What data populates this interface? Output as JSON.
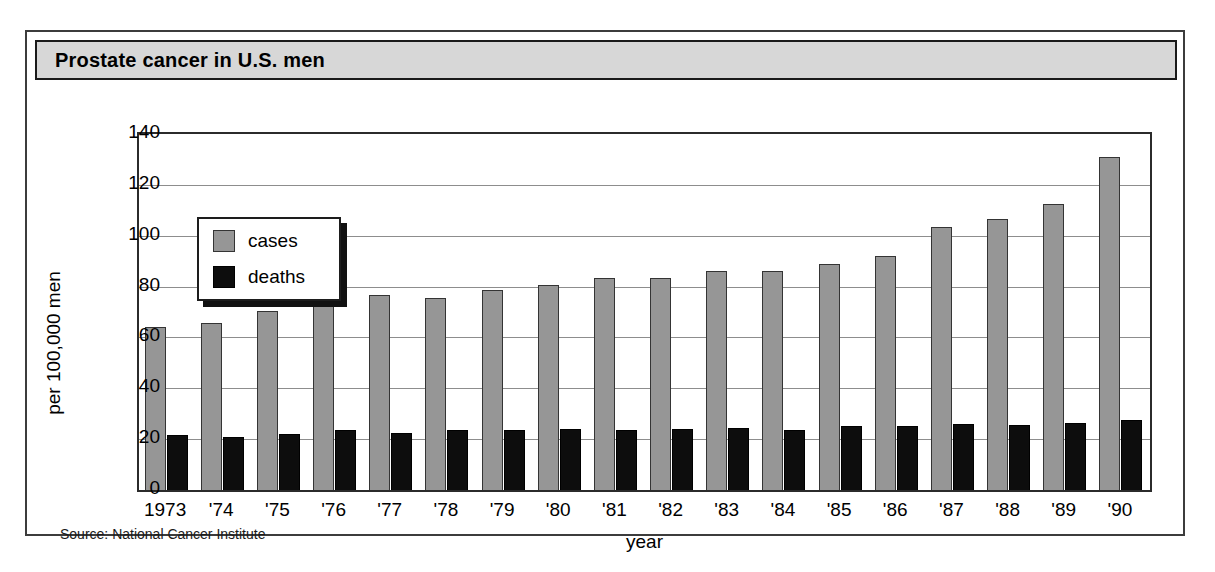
{
  "figure": {
    "title": "Prostate cancer in U.S. men",
    "source": "Source: National Cancer Institute"
  },
  "colors": {
    "cases": "#969696",
    "deaths": "#0d0d0d",
    "title_bar": "#d7d7d7",
    "frame": "#3c3c3c",
    "gridline": "#8d8d8d"
  },
  "legend": {
    "position": "upper-left-inside",
    "items": [
      {
        "label": "cases",
        "color": "#969696"
      },
      {
        "label": "deaths",
        "color": "#0d0d0d"
      }
    ]
  },
  "chart_data": {
    "type": "bar",
    "title": "Prostate cancer in U.S. men",
    "xlabel": "year",
    "ylabel": "per 100,000 men",
    "ylim": [
      0,
      140
    ],
    "yticks": [
      0,
      20,
      40,
      60,
      80,
      100,
      120,
      140
    ],
    "ytick_labels": [
      "0",
      "20",
      "40",
      "60",
      "80",
      "100",
      "120",
      "140"
    ],
    "grid": true,
    "legend_position": "upper left",
    "categories": [
      "1973",
      "'74",
      "'75",
      "'76",
      "'77",
      "'78",
      "'79",
      "'80",
      "'81",
      "'82",
      "'83",
      "'84",
      "'85",
      "'86",
      "'87",
      "'88",
      "'89",
      "'90"
    ],
    "series": [
      {
        "name": "cases",
        "color": "#969696",
        "values": [
          64,
          65.5,
          70.5,
          74,
          76.5,
          75.5,
          78.5,
          80.5,
          83.5,
          83.5,
          86,
          86,
          89,
          92,
          103.5,
          106.5,
          112.5,
          131
        ]
      },
      {
        "name": "deaths",
        "color": "#0d0d0d",
        "values": [
          21.5,
          21,
          22,
          23.5,
          22.5,
          23.5,
          23.5,
          24,
          23.5,
          24,
          24.5,
          23.5,
          25,
          25,
          26,
          25.5,
          26.5,
          27.5
        ]
      }
    ]
  }
}
